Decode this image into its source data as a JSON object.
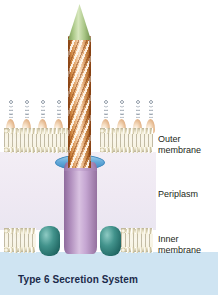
{
  "figure": {
    "caption": "Type 6 Secretion System",
    "title": "Type 6 Secretion System"
  },
  "labels": {
    "outer_membrane": "Outer\nmembrane",
    "periplasm": "Periplasm",
    "inner_membrane": "Inner\nmembrane"
  },
  "structures": {
    "spike_tip": "vgrg-spike-tip",
    "sheath": "contractile-sheath",
    "outer_membrane_complex": "outer-membrane-channel-disc",
    "baseplate": "baseplate-tube",
    "inner_membrane_protein": "inner-membrane-anchor-protein",
    "lps": "lipopolysaccharide-chain",
    "bilayer": "phospholipid-bilayer"
  },
  "compartments": {
    "extracellular": "extracellular-space",
    "periplasm": "periplasm",
    "cytoplasm": "cytoplasm"
  },
  "colors": {
    "spike_tip": "#a9c786",
    "sheath": "#d08a46",
    "blue_disc": "#62a8d8",
    "baseplate": "#b08ebd",
    "inner_membrane_protein": "#42938c",
    "membrane": "#f7f3e2",
    "lps_bead": "#9aa3ad",
    "lps_core": "#e2b184",
    "periplasm_bg": "#efe9f3",
    "cytoplasm_bg": "#cfe4f2",
    "extracellular_bg": "#ffffff",
    "label_text": "#231f20",
    "caption_text": "#1b2a4a"
  },
  "lps_chains": [
    {
      "x": 6
    },
    {
      "x": 22
    },
    {
      "x": 38
    },
    {
      "x": 54
    },
    {
      "x": 70
    },
    {
      "x": 101
    },
    {
      "x": 117
    },
    {
      "x": 133
    },
    {
      "x": 147
    }
  ]
}
